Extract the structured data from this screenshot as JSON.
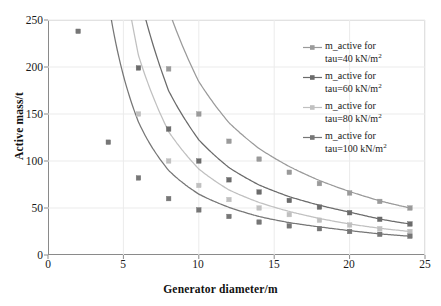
{
  "chart_data": {
    "type": "line",
    "title": "",
    "xlabel": "Generator diameter/m",
    "ylabel": "Active mass/t",
    "xlim": [
      0,
      25
    ],
    "ylim": [
      0,
      250
    ],
    "xticks": [
      0,
      5,
      10,
      15,
      20,
      25
    ],
    "yticks": [
      0,
      50,
      100,
      150,
      200,
      250
    ],
    "grid": true,
    "legend_position": "right",
    "x": [
      2,
      4,
      6,
      8,
      10,
      12,
      14,
      16,
      18,
      20,
      22,
      24
    ],
    "series": [
      {
        "name": "m_active for tau=40 kN/m2",
        "tau": 40,
        "unit": "kN/m2",
        "color": "#9a9a9a",
        "values": [
          null,
          null,
          280,
          198,
          150,
          121,
          102,
          88,
          76,
          66,
          57,
          50
        ]
      },
      {
        "name": "m_active for tau=60 kN/m2",
        "tau": 60,
        "unit": "kN/m2",
        "color": "#6b6b6b",
        "values": [
          null,
          318,
          199,
          134,
          100,
          80,
          67,
          58,
          51,
          45,
          38,
          33
        ]
      },
      {
        "name": "m_active for tau=80 kN/m2",
        "tau": 80,
        "unit": "kN/m2",
        "color": "#c0c0c0",
        "values": [
          null,
          270,
          150,
          100,
          74,
          59,
          50,
          43,
          37,
          32,
          28,
          25
        ]
      },
      {
        "name": "m_active for tau=100 kN/m2",
        "tau": 100,
        "unit": "kN/m2",
        "color": "#767676",
        "values": [
          238,
          120,
          82,
          60,
          48,
          41,
          35,
          31,
          28,
          25,
          22,
          20
        ]
      }
    ]
  },
  "legend": {
    "items": [
      {
        "line1": "m_active for",
        "line2_prefix": "tau=40 kN/m",
        "exponent": "2",
        "color": "#9a9a9a"
      },
      {
        "line1": "m_active for",
        "line2_prefix": "tau=60 kN/m",
        "exponent": "2",
        "color": "#6b6b6b"
      },
      {
        "line1": "m_active for",
        "line2_prefix": "tau=80 kN/m",
        "exponent": "2",
        "color": "#c0c0c0"
      },
      {
        "line1": "m_active for",
        "line2_prefix": "tau=100 kN/m",
        "exponent": "2",
        "color": "#767676"
      }
    ]
  },
  "axes": {
    "x_title": "Generator diameter/m",
    "y_title": "Active mass/t",
    "x_tick_labels": [
      "0",
      "5",
      "10",
      "15",
      "20",
      "25"
    ],
    "y_tick_labels": [
      "0",
      "50",
      "100",
      "150",
      "200",
      "250"
    ]
  },
  "style": {
    "grid_color": "#ebebeb",
    "frame_color": "#8a8a8a",
    "background": "#ffffff"
  }
}
